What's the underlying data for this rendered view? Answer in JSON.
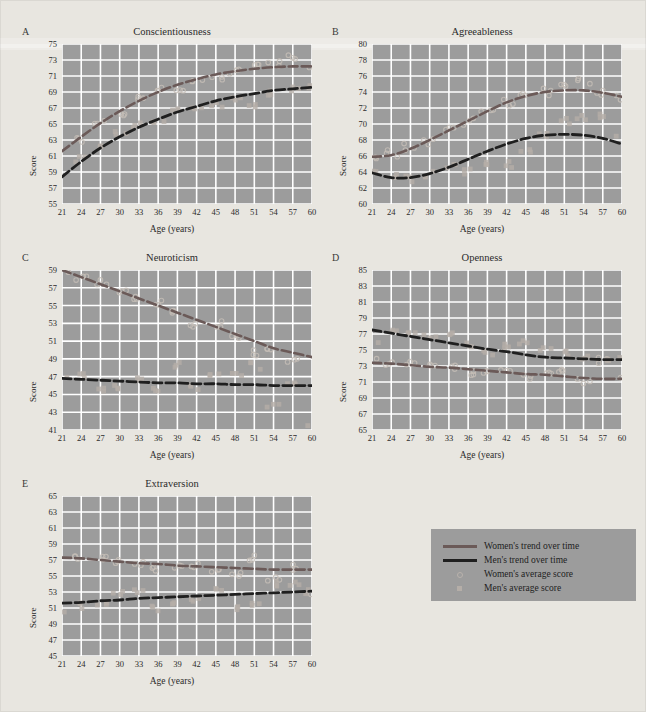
{
  "figure": {
    "background_color": "#e8e6e0",
    "plot_background_color": "#9c9c9c",
    "grid_color": "#ffffff",
    "women_line_color": "#6b5a58",
    "men_line_color": "#1f1f1f",
    "women_marker_color": "#c4bdb6",
    "men_marker_color": "#b5aea8"
  },
  "legend": {
    "items": [
      {
        "label": "Women's trend over time",
        "style": "women-line"
      },
      {
        "label": "Men's trend over time",
        "style": "men-line"
      },
      {
        "label": "Women's average score",
        "style": "women-marker"
      },
      {
        "label": "Men's average score",
        "style": "men-marker"
      }
    ]
  },
  "axis_common": {
    "xlabel": "Age (years)",
    "ylabel": "Score",
    "xticks": [
      21,
      24,
      27,
      30,
      33,
      36,
      39,
      42,
      45,
      48,
      51,
      54,
      57,
      60
    ],
    "xlim": [
      21,
      60
    ]
  },
  "chart_data": [
    {
      "type": "line",
      "panel": "A",
      "title": "Conscientiousness",
      "xlabel": "Age (years)",
      "ylabel": "Score",
      "xlim": [
        21,
        60
      ],
      "ylim": [
        55,
        75
      ],
      "yticks": [
        55,
        57,
        59,
        61,
        63,
        65,
        67,
        69,
        71,
        73,
        75
      ],
      "xticks": [
        21,
        24,
        27,
        30,
        33,
        36,
        39,
        42,
        45,
        48,
        51,
        54,
        57,
        60
      ],
      "grid": true,
      "legend_position": "external",
      "x": [
        21,
        24,
        27,
        30,
        33,
        36,
        39,
        42,
        45,
        48,
        51,
        54,
        57,
        60
      ],
      "series": [
        {
          "name": "Women's trend over time",
          "values": [
            61.6,
            63.4,
            65.1,
            66.6,
            67.9,
            69.0,
            69.9,
            70.6,
            71.2,
            71.6,
            71.9,
            72.1,
            72.2,
            72.2
          ]
        },
        {
          "name": "Men's trend over time",
          "values": [
            58.4,
            60.3,
            62.0,
            63.4,
            64.6,
            65.6,
            66.5,
            67.2,
            67.9,
            68.4,
            68.8,
            69.2,
            69.4,
            69.6
          ]
        },
        {
          "name": "Women's average score",
          "values": [
            58.9,
            63.0,
            65.4,
            66.2,
            68.2,
            69.4,
            69.3,
            70.6,
            70.9,
            71.6,
            72.3,
            72.6,
            73.4,
            72.4
          ],
          "marker": "circle"
        },
        {
          "name": "Men's average score",
          "values": [
            58.6,
            60.6,
            61.9,
            63.7,
            64.8,
            65.3,
            66.6,
            67.0,
            67.3,
            68.1,
            67.1,
            68.9,
            69.5,
            69.8
          ],
          "marker": "square"
        }
      ]
    },
    {
      "type": "line",
      "panel": "B",
      "title": "Agreeableness",
      "xlabel": "Age (years)",
      "ylabel": "Score",
      "xlim": [
        21,
        60
      ],
      "ylim": [
        60,
        80
      ],
      "yticks": [
        60,
        62,
        64,
        66,
        68,
        70,
        72,
        74,
        76,
        78,
        80
      ],
      "xticks": [
        21,
        24,
        27,
        30,
        33,
        36,
        39,
        42,
        45,
        48,
        51,
        54,
        57,
        60
      ],
      "grid": true,
      "legend_position": "external",
      "x": [
        21,
        24,
        27,
        30,
        33,
        36,
        39,
        42,
        45,
        48,
        51,
        54,
        57,
        60
      ],
      "series": [
        {
          "name": "Women's trend over time",
          "values": [
            65.9,
            66.1,
            66.9,
            68.0,
            69.2,
            70.4,
            71.6,
            72.7,
            73.5,
            74.0,
            74.2,
            74.2,
            73.9,
            73.4
          ]
        },
        {
          "name": "Men's trend over time",
          "values": [
            63.9,
            63.3,
            63.3,
            63.8,
            64.6,
            65.6,
            66.6,
            67.5,
            68.2,
            68.6,
            68.7,
            68.6,
            68.2,
            67.5
          ]
        },
        {
          "name": "Women's average score",
          "values": [
            66.0,
            66.2,
            67.0,
            68.0,
            69.3,
            70.4,
            71.8,
            72.7,
            73.4,
            74.0,
            74.4,
            75.4,
            73.8,
            73.5
          ]
        },
        {
          "name": "Men's average score",
          "values": [
            64.0,
            63.4,
            63.2,
            63.8,
            64.5,
            64.2,
            65.3,
            64.8,
            66.4,
            68.3,
            70.3,
            70.9,
            70.9,
            68.4
          ]
        }
      ]
    },
    {
      "type": "line",
      "panel": "C",
      "title": "Neuroticism",
      "xlabel": "Age (years)",
      "ylabel": "Score",
      "xlim": [
        21,
        60
      ],
      "ylim": [
        41,
        59
      ],
      "yticks": [
        41,
        43,
        45,
        47,
        49,
        51,
        53,
        55,
        57,
        59
      ],
      "xticks": [
        21,
        24,
        27,
        30,
        33,
        36,
        39,
        42,
        45,
        48,
        51,
        54,
        57,
        60
      ],
      "grid": true,
      "legend_position": "external",
      "x": [
        21,
        24,
        27,
        30,
        33,
        36,
        39,
        42,
        45,
        48,
        51,
        54,
        57,
        60
      ],
      "series": [
        {
          "name": "Women's trend over time",
          "values": [
            59.0,
            58.2,
            57.4,
            56.6,
            55.8,
            55.0,
            54.2,
            53.4,
            52.6,
            51.8,
            51.0,
            50.2,
            49.7,
            49.2
          ]
        },
        {
          "name": "Men's trend over time",
          "values": [
            46.8,
            46.7,
            46.6,
            46.5,
            46.4,
            46.3,
            46.3,
            46.2,
            46.2,
            46.1,
            46.1,
            46.0,
            46.0,
            46.0
          ]
        },
        {
          "name": "Women's average score",
          "values": [
            59.0,
            58.0,
            57.4,
            56.5,
            55.6,
            55.2,
            54.4,
            53.0,
            52.8,
            51.4,
            49.6,
            50.1,
            48.6,
            49.5
          ]
        },
        {
          "name": "Men's average score",
          "values": [
            46.9,
            46.9,
            45.6,
            45.6,
            46.6,
            45.2,
            48.4,
            46.0,
            46.9,
            47.4,
            48.1,
            43.9,
            46.6,
            41.2
          ]
        }
      ]
    },
    {
      "type": "line",
      "panel": "D",
      "title": "Openness",
      "xlabel": "Age (years)",
      "ylabel": "Score",
      "xlim": [
        21,
        60
      ],
      "ylim": [
        65,
        85
      ],
      "yticks": [
        65,
        67,
        69,
        71,
        73,
        75,
        77,
        79,
        81,
        83,
        85
      ],
      "xticks": [
        21,
        24,
        27,
        30,
        33,
        36,
        39,
        42,
        45,
        48,
        51,
        54,
        57,
        60
      ],
      "grid": true,
      "legend_position": "external",
      "x": [
        21,
        24,
        27,
        30,
        33,
        36,
        39,
        42,
        45,
        48,
        51,
        54,
        57,
        60
      ],
      "series": [
        {
          "name": "Women's trend over time",
          "values": [
            73.4,
            73.3,
            73.1,
            72.9,
            72.8,
            72.6,
            72.4,
            72.2,
            72.0,
            71.9,
            71.7,
            71.5,
            71.4,
            71.4
          ]
        },
        {
          "name": "Men's trend over time",
          "values": [
            77.5,
            77.1,
            76.7,
            76.3,
            75.9,
            75.5,
            75.1,
            74.8,
            74.4,
            74.1,
            74.0,
            73.9,
            73.8,
            73.8
          ]
        },
        {
          "name": "Women's average score",
          "values": [
            74.0,
            73.4,
            73.2,
            73.1,
            72.9,
            72.2,
            72.3,
            72.7,
            71.6,
            72.0,
            72.2,
            71.1,
            73.7,
            71.3
          ]
        },
        {
          "name": "Men's average score",
          "values": [
            76.1,
            77.5,
            77.2,
            76.8,
            77.0,
            75.6,
            74.6,
            75.5,
            76.1,
            75.3,
            74.6,
            74.1,
            73.6,
            73.8
          ]
        }
      ]
    },
    {
      "type": "line",
      "panel": "E",
      "title": "Extraversion",
      "xlabel": "Age (years)",
      "ylabel": "Score",
      "xlim": [
        21,
        60
      ],
      "ylim": [
        45,
        65
      ],
      "yticks": [
        45,
        47,
        49,
        51,
        53,
        55,
        57,
        59,
        61,
        63,
        65
      ],
      "xticks": [
        21,
        24,
        27,
        30,
        33,
        36,
        39,
        42,
        45,
        48,
        51,
        54,
        57,
        60
      ],
      "grid": true,
      "legend_position": "external",
      "x": [
        21,
        24,
        27,
        30,
        33,
        36,
        39,
        42,
        45,
        48,
        51,
        54,
        57,
        60
      ],
      "series": [
        {
          "name": "Women's trend over time",
          "values": [
            57.3,
            57.2,
            57.0,
            56.8,
            56.6,
            56.5,
            56.3,
            56.2,
            56.1,
            56.0,
            55.9,
            55.8,
            55.8,
            55.8
          ]
        },
        {
          "name": "Men's trend over time",
          "values": [
            51.6,
            51.7,
            51.9,
            52.0,
            52.2,
            52.3,
            52.4,
            52.5,
            52.6,
            52.7,
            52.8,
            52.9,
            53.0,
            53.1
          ]
        },
        {
          "name": "Women's average score",
          "values": [
            57.4,
            57.2,
            57.1,
            56.9,
            56.5,
            56.0,
            56.2,
            56.4,
            55.8,
            55.3,
            57.3,
            54.6,
            56.1,
            53.0
          ]
        },
        {
          "name": "Men's average score",
          "values": [
            50.6,
            51.3,
            51.6,
            53.0,
            53.2,
            51.0,
            51.4,
            52.0,
            53.4,
            51.0,
            51.6,
            54.0,
            54.2,
            53.1
          ]
        }
      ]
    }
  ]
}
